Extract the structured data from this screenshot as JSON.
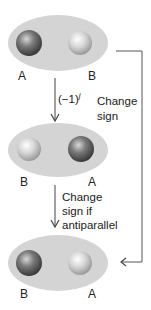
{
  "states": [
    {
      "left_label": "A",
      "right_label": "B",
      "left_sphere": "dark",
      "right_sphere": "light"
    },
    {
      "left_label": "B",
      "right_label": "A",
      "left_sphere": "light",
      "right_sphere": "dark"
    },
    {
      "left_label": "B",
      "right_label": "A",
      "left_sphere": "dark",
      "right_sphere": "light"
    }
  ],
  "arrow1": {
    "label_base": "(−1)",
    "label_exp": "j"
  },
  "arrow2": {
    "lines": [
      "Change",
      "sign if",
      "antiparallel"
    ]
  },
  "bracket": {
    "lines": [
      "Change",
      "sign"
    ]
  },
  "colors": {
    "ellipse": "#d4d4d4",
    "dark_sphere": "#5a5a5a",
    "light_sphere": "#c8c8c8",
    "line": "#444444"
  }
}
